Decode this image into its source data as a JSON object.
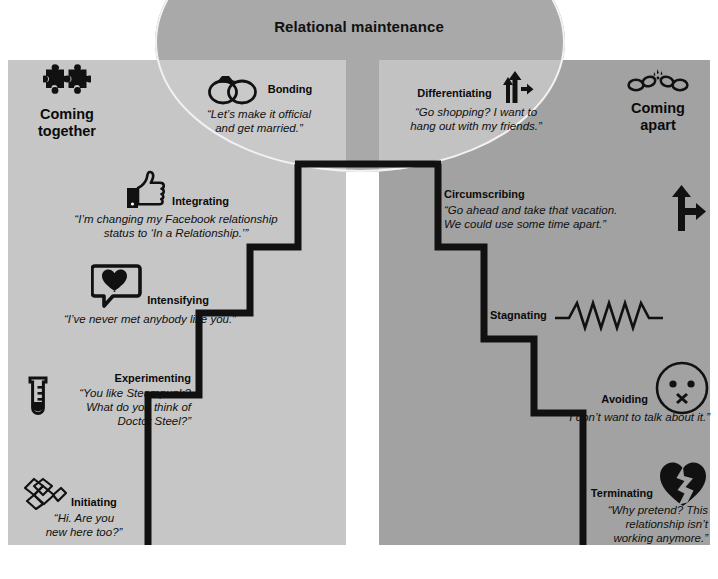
{
  "diagram": {
    "ellipse_title": "Relational maintenance",
    "colors": {
      "left_panel": "#c6c6c6",
      "right_panel": "#a2a2a2",
      "ellipse": "#a9a9a9",
      "ellipse_outline": "#f2f2f2",
      "line": "#111111",
      "text": "#0b0b0b",
      "background": "#ffffff"
    }
  },
  "headers": {
    "left": {
      "label": "Coming\ntogether",
      "line1": "Coming",
      "line2": "together",
      "icon": "puzzle-pieces-icon"
    },
    "right": {
      "label": "Coming\napart",
      "line1": "Coming",
      "line2": "apart",
      "icon": "broken-chain-icon"
    }
  },
  "coming_together": {
    "stages": [
      {
        "name": "Bonding",
        "icon": "wedding-rings-icon",
        "quote_lines": [
          "“Let’s make it official",
          "and get married.”"
        ]
      },
      {
        "name": "Integrating",
        "icon": "thumbs-up-icon",
        "quote_lines": [
          "“I’m changing my Facebook relationship",
          "status to ‘In a Relationship.’”"
        ]
      },
      {
        "name": "Intensifying",
        "icon": "heart-speech-bubble-icon",
        "quote_lines": [
          "“I’ve never met anybody like you.”"
        ]
      },
      {
        "name": "Experimenting",
        "icon": "test-tube-icon",
        "quote_lines": [
          "“You like Steampunk?",
          "What do you think of",
          "Doctor Steel?”"
        ]
      },
      {
        "name": "Initiating",
        "icon": "handshake-icon",
        "quote_lines": [
          "“Hi. Are you",
          "new here too?”"
        ]
      }
    ]
  },
  "coming_apart": {
    "stages": [
      {
        "name": "Differentiating",
        "icon": "diverging-arrows-icon",
        "quote_lines": [
          "“Go shopping? I want to",
          "hang out with my friends.”"
        ]
      },
      {
        "name": "Circumscribing",
        "icon": "forking-arrow-icon",
        "quote_lines": [
          "“Go ahead and take that vacation.",
          "We could use some time apart.”"
        ]
      },
      {
        "name": "Stagnating",
        "icon": "flatline-zigzag-icon",
        "quote_lines": []
      },
      {
        "name": "Avoiding",
        "icon": "face-x-mouth-icon",
        "quote_lines": [
          "“I don’t want to talk about it.”"
        ]
      },
      {
        "name": "Terminating",
        "icon": "broken-heart-icon",
        "quote_lines": [
          "“Why pretend? This",
          "relationship isn’t",
          "working anymore.”"
        ]
      }
    ]
  }
}
